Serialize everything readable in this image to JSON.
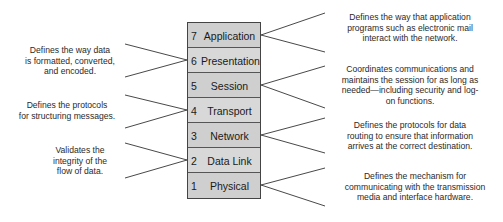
{
  "diagram": {
    "type": "OSI model layer stack",
    "colors": {
      "layer_fill": "#cfcfcf",
      "layer_border": "#444444",
      "line": "#333333",
      "text": "#222222"
    },
    "layers": [
      {
        "number": "7",
        "name": "Application",
        "side": "right",
        "description": "Defines the way that application programs such as electronic mail interact with the network."
      },
      {
        "number": "6",
        "name": "Presentation",
        "side": "left",
        "description": "Defines the way data is formatted, converted, and encoded."
      },
      {
        "number": "5",
        "name": "Session",
        "side": "right",
        "description": "Coordinates communications and maintains the session for as long as needed—including security and log-on functions."
      },
      {
        "number": "4",
        "name": "Transport",
        "side": "left",
        "description": "Defines the protocols for structuring messages."
      },
      {
        "number": "3",
        "name": "Network",
        "side": "right",
        "description": "Defines the protocols for data routing to ensure that information arrives at the correct destination."
      },
      {
        "number": "2",
        "name": "Data Link",
        "side": "left",
        "description": "Validates the integrity of the flow of data."
      },
      {
        "number": "1",
        "name": "Physical",
        "side": "right",
        "description": "Defines the mechanism for communicating with the transmission media and interface hardware."
      }
    ]
  },
  "desc_lines": {
    "l7": [
      "Defines the way that application",
      "programs such as electronic mail",
      "interact with the network."
    ],
    "l6": [
      "Defines the way data",
      "is formatted, converted,",
      "and encoded."
    ],
    "l5": [
      "Coordinates communications and",
      "maintains the session for as long as",
      "needed—including security and log-",
      "on functions."
    ],
    "l4": [
      "Defines the protocols",
      "for structuring messages."
    ],
    "l3": [
      "Defines the protocols for data",
      "routing to ensure that information",
      "arrives at the correct destination."
    ],
    "l2": [
      "Validates the",
      "integrity of the",
      "flow of data."
    ],
    "l1": [
      "Defines the mechanism for",
      "communicating with the transmission",
      "media and interface hardware."
    ]
  }
}
